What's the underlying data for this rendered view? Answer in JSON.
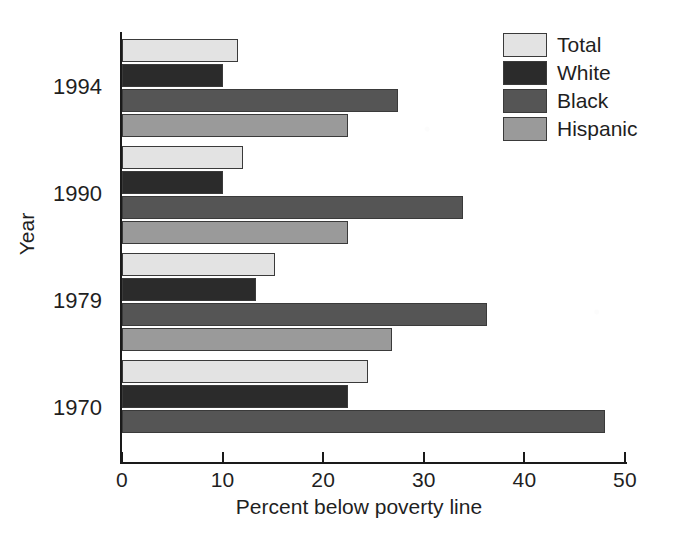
{
  "chart_data": {
    "type": "bar",
    "orientation": "horizontal",
    "title": "",
    "xlabel": "Percent below poverty line",
    "ylabel": "Year",
    "xlim": [
      0,
      50
    ],
    "xticks": [
      0,
      10,
      20,
      30,
      40,
      50
    ],
    "xticklabels": [
      "0",
      "10",
      "20",
      "30",
      "40",
      "50"
    ],
    "categories": [
      "1994",
      "1990",
      "1979",
      "1970"
    ],
    "grid": false,
    "legend_position": "top-right",
    "series": [
      {
        "name": "Total",
        "color": "#e3e3e3",
        "values": [
          11.5,
          12.0,
          15.2,
          24.5
        ]
      },
      {
        "name": "White",
        "color": "#2b2b2b",
        "values": [
          10.0,
          10.0,
          13.3,
          22.5
        ]
      },
      {
        "name": "Black",
        "color": "#555555",
        "values": [
          27.4,
          33.9,
          36.3,
          48.0
        ]
      },
      {
        "name": "Hispanic",
        "color": "#9a9a9a",
        "values": [
          22.5,
          22.5,
          26.8,
          null
        ]
      }
    ]
  },
  "axes": {
    "x_title": "Percent below poverty line",
    "y_title": "Year",
    "x_tick_labels": [
      "0",
      "10",
      "20",
      "30",
      "40",
      "50"
    ],
    "y_tick_labels": [
      "1994",
      "1990",
      "1979",
      "1970"
    ]
  },
  "legend": {
    "entries": [
      {
        "label": "Total",
        "swatch": "#e3e3e3"
      },
      {
        "label": "White",
        "swatch": "#2b2b2b"
      },
      {
        "label": "Black",
        "swatch": "#555555"
      },
      {
        "label": "Hispanic",
        "swatch": "#9a9a9a"
      }
    ]
  }
}
